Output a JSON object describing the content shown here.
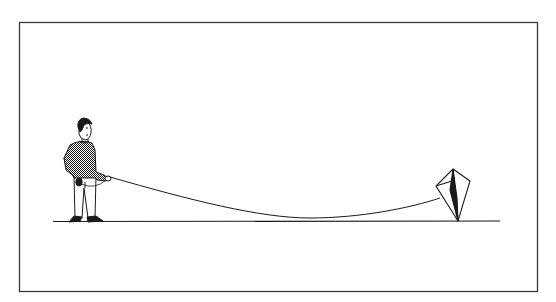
{
  "illustration": {
    "description": "Line drawing of a person standing on the ground holding a string attached to a kite resting on the ground",
    "colors": {
      "background": "#ffffff",
      "ink": "#1a1a1a",
      "frame": "#3a3a3a"
    },
    "frame": {
      "x": 19,
      "y": 22,
      "width": 519,
      "height": 270
    },
    "ground": {
      "x1": 53,
      "x2": 500,
      "y": 221
    },
    "person": {
      "label": "person holding kite string"
    },
    "kite": {
      "label": "kite lying on ground"
    },
    "string": {
      "label": "sagging kite string"
    }
  }
}
